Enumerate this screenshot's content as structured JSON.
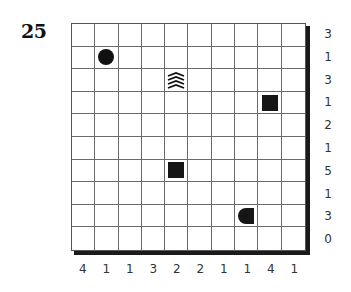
{
  "puzzle": {
    "number": "25",
    "rows": 10,
    "cols": 10,
    "row_clues": [
      "3",
      "1",
      "3",
      "1",
      "2",
      "1",
      "5",
      "1",
      "3",
      "0"
    ],
    "col_clues": [
      "4",
      "1",
      "1",
      "3",
      "2",
      "2",
      "1",
      "1",
      "4",
      "1"
    ],
    "given_cells": [
      {
        "row": 1,
        "col": 1,
        "type": "circle",
        "icon": "submarine-circle-icon"
      },
      {
        "row": 2,
        "col": 4,
        "type": "water",
        "icon": "water-waves-icon"
      },
      {
        "row": 3,
        "col": 8,
        "type": "square",
        "icon": "ship-middle-square-icon"
      },
      {
        "row": 6,
        "col": 4,
        "type": "square",
        "icon": "ship-middle-square-icon"
      },
      {
        "row": 8,
        "col": 7,
        "type": "end-left",
        "icon": "ship-end-left-icon"
      }
    ],
    "colors": {
      "ink": "#111111",
      "grid_line": "#6a6a6a",
      "background": "#ffffff"
    }
  }
}
